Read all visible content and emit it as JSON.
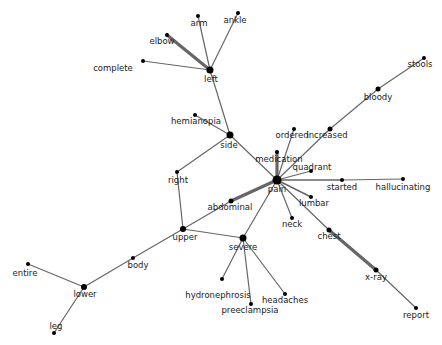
{
  "diagram": {
    "type": "word-cooccurrence-network",
    "edge_color": "#666666",
    "node_color": "#000000",
    "label_color": "#222222",
    "nodes": [
      {
        "id": "pain",
        "label": "pain",
        "x": 277,
        "y": 180,
        "r": 4.5,
        "lx": 277,
        "ly": 192,
        "anchor": "middle"
      },
      {
        "id": "side",
        "label": "side",
        "x": 230,
        "y": 135,
        "r": 3.5,
        "lx": 229,
        "ly": 148,
        "anchor": "middle"
      },
      {
        "id": "left",
        "label": "left",
        "x": 210,
        "y": 70,
        "r": 3.5,
        "lx": 211,
        "ly": 82,
        "anchor": "middle"
      },
      {
        "id": "arm",
        "label": "arm",
        "x": 198,
        "y": 16,
        "r": 2,
        "lx": 199,
        "ly": 26,
        "anchor": "middle"
      },
      {
        "id": "ankle",
        "label": "ankle",
        "x": 238,
        "y": 13,
        "r": 2,
        "lx": 235,
        "ly": 23,
        "anchor": "middle"
      },
      {
        "id": "elbow",
        "label": "elbow",
        "x": 167,
        "y": 35,
        "r": 2,
        "lx": 162,
        "ly": 44,
        "anchor": "middle"
      },
      {
        "id": "complete",
        "label": "complete",
        "x": 143,
        "y": 61,
        "r": 2,
        "lx": 113,
        "ly": 71,
        "anchor": "middle"
      },
      {
        "id": "hemianopia",
        "label": "hemianopia",
        "x": 195,
        "y": 115,
        "r": 2,
        "lx": 196,
        "ly": 124,
        "anchor": "middle"
      },
      {
        "id": "right",
        "label": "right",
        "x": 177,
        "y": 172,
        "r": 2,
        "lx": 178,
        "ly": 183,
        "anchor": "middle"
      },
      {
        "id": "upper",
        "label": "upper",
        "x": 183,
        "y": 229,
        "r": 3,
        "lx": 185,
        "ly": 240,
        "anchor": "middle"
      },
      {
        "id": "abdominal",
        "label": "abdominal",
        "x": 231,
        "y": 201,
        "r": 2.5,
        "lx": 230,
        "ly": 210,
        "anchor": "middle"
      },
      {
        "id": "severe",
        "label": "severe",
        "x": 243,
        "y": 238,
        "r": 3.5,
        "lx": 243,
        "ly": 250,
        "anchor": "middle"
      },
      {
        "id": "medication",
        "label": "medication",
        "x": 277,
        "y": 152,
        "r": 2,
        "lx": 279,
        "ly": 162,
        "anchor": "middle"
      },
      {
        "id": "ordered",
        "label": "ordered",
        "x": 294,
        "y": 129,
        "r": 2,
        "lx": 292,
        "ly": 138,
        "anchor": "middle"
      },
      {
        "id": "increased",
        "label": "increased",
        "x": 330,
        "y": 129,
        "r": 2.5,
        "lx": 327,
        "ly": 138,
        "anchor": "middle"
      },
      {
        "id": "bloody",
        "label": "bloody",
        "x": 378,
        "y": 89,
        "r": 2.5,
        "lx": 378,
        "ly": 100,
        "anchor": "middle"
      },
      {
        "id": "stools",
        "label": "stools",
        "x": 424,
        "y": 58,
        "r": 2,
        "lx": 420,
        "ly": 67,
        "anchor": "middle"
      },
      {
        "id": "quadrant",
        "label": "quadrant",
        "x": 311,
        "y": 171,
        "r": 2,
        "lx": 312,
        "ly": 170,
        "anchor": "middle"
      },
      {
        "id": "started",
        "label": "started",
        "x": 342,
        "y": 180,
        "r": 2,
        "lx": 342,
        "ly": 190,
        "anchor": "middle"
      },
      {
        "id": "hallucinating",
        "label": "hallucinating",
        "x": 403,
        "y": 179,
        "r": 2,
        "lx": 403,
        "ly": 190,
        "anchor": "middle"
      },
      {
        "id": "lumbar",
        "label": "lumbar",
        "x": 311,
        "y": 197,
        "r": 2,
        "lx": 314,
        "ly": 206,
        "anchor": "middle"
      },
      {
        "id": "neck",
        "label": "neck",
        "x": 292,
        "y": 218,
        "r": 2,
        "lx": 292,
        "ly": 227,
        "anchor": "middle"
      },
      {
        "id": "chest",
        "label": "chest",
        "x": 329,
        "y": 230,
        "r": 2.5,
        "lx": 329,
        "ly": 239,
        "anchor": "middle"
      },
      {
        "id": "x-ray",
        "label": "x-ray",
        "x": 376,
        "y": 270,
        "r": 2.5,
        "lx": 376,
        "ly": 280,
        "anchor": "middle"
      },
      {
        "id": "report",
        "label": "report",
        "x": 416,
        "y": 308,
        "r": 2,
        "lx": 416,
        "ly": 318,
        "anchor": "middle"
      },
      {
        "id": "hydronephrosis",
        "label": "hydronephrosis",
        "x": 222,
        "y": 279,
        "r": 2,
        "lx": 218,
        "ly": 298,
        "anchor": "middle"
      },
      {
        "id": "preeclampsia",
        "label": "preeclampsia",
        "x": 251,
        "y": 304,
        "r": 2,
        "lx": 250,
        "ly": 313,
        "anchor": "middle"
      },
      {
        "id": "headaches",
        "label": "headaches",
        "x": 285,
        "y": 294,
        "r": 2,
        "lx": 285,
        "ly": 303,
        "anchor": "middle"
      },
      {
        "id": "body",
        "label": "body",
        "x": 133,
        "y": 258,
        "r": 2,
        "lx": 138,
        "ly": 268,
        "anchor": "middle"
      },
      {
        "id": "lower",
        "label": "lower",
        "x": 84,
        "y": 287,
        "r": 3,
        "lx": 85,
        "ly": 297,
        "anchor": "middle"
      },
      {
        "id": "entire",
        "label": "entire",
        "x": 28,
        "y": 264,
        "r": 2,
        "lx": 25,
        "ly": 276,
        "anchor": "middle"
      },
      {
        "id": "leg",
        "label": "leg",
        "x": 54,
        "y": 333,
        "r": 2,
        "lx": 56,
        "ly": 329,
        "anchor": "middle"
      }
    ],
    "edges": [
      {
        "s": "left",
        "t": "arm",
        "w": 1.2
      },
      {
        "s": "left",
        "t": "ankle",
        "w": 1.2
      },
      {
        "s": "left",
        "t": "elbow",
        "w": 3.2
      },
      {
        "s": "left",
        "t": "complete",
        "w": 1.2
      },
      {
        "s": "left",
        "t": "side",
        "w": 1.2
      },
      {
        "s": "side",
        "t": "hemianopia",
        "w": 1.2
      },
      {
        "s": "side",
        "t": "pain",
        "w": 1.2
      },
      {
        "s": "side",
        "t": "right",
        "w": 1.2
      },
      {
        "s": "right",
        "t": "upper",
        "w": 1.2
      },
      {
        "s": "upper",
        "t": "abdominal",
        "w": 1.2
      },
      {
        "s": "upper",
        "t": "severe",
        "w": 1.2
      },
      {
        "s": "upper",
        "t": "body",
        "w": 1.2
      },
      {
        "s": "body",
        "t": "lower",
        "w": 1.2
      },
      {
        "s": "lower",
        "t": "entire",
        "w": 1.2
      },
      {
        "s": "lower",
        "t": "leg",
        "w": 1.2
      },
      {
        "s": "abdominal",
        "t": "pain",
        "w": 3.2
      },
      {
        "s": "severe",
        "t": "pain",
        "w": 1.2
      },
      {
        "s": "severe",
        "t": "hydronephrosis",
        "w": 1.2
      },
      {
        "s": "severe",
        "t": "preeclampsia",
        "w": 1.2
      },
      {
        "s": "severe",
        "t": "headaches",
        "w": 1.2
      },
      {
        "s": "pain",
        "t": "medication",
        "w": 3.2
      },
      {
        "s": "pain",
        "t": "ordered",
        "w": 1.2
      },
      {
        "s": "pain",
        "t": "increased",
        "w": 1.2
      },
      {
        "s": "increased",
        "t": "bloody",
        "w": 1.2
      },
      {
        "s": "bloody",
        "t": "stools",
        "w": 1.2
      },
      {
        "s": "pain",
        "t": "quadrant",
        "w": 1.2
      },
      {
        "s": "pain",
        "t": "started",
        "w": 1.5
      },
      {
        "s": "started",
        "t": "hallucinating",
        "w": 1.2
      },
      {
        "s": "pain",
        "t": "lumbar",
        "w": 1.5
      },
      {
        "s": "pain",
        "t": "neck",
        "w": 1.2
      },
      {
        "s": "pain",
        "t": "chest",
        "w": 1.2
      },
      {
        "s": "chest",
        "t": "x-ray",
        "w": 3.2
      },
      {
        "s": "x-ray",
        "t": "report",
        "w": 1.2
      }
    ]
  }
}
